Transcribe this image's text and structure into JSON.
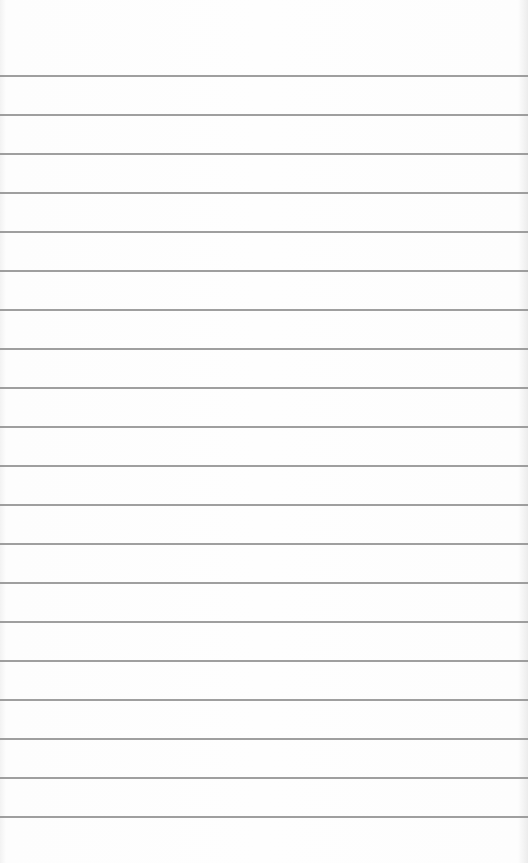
{
  "paper": {
    "type": "ruled-sheet",
    "background_color": "#fdfdfd",
    "rule_color": "#8e8e8e",
    "first_rule_y": 75,
    "rule_spacing": 39,
    "rule_count": 20
  }
}
